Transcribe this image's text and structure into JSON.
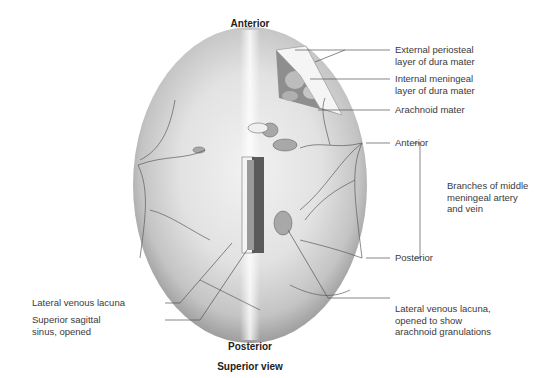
{
  "figure": {
    "orientation_top": "Anterior",
    "orientation_bottom": "Posterior",
    "caption": "Superior view"
  },
  "labels_right": {
    "external_periosteal": "External periosteal\nlayer of dura mater",
    "internal_meningeal": "Internal meningeal\nlayer of dura mater",
    "arachnoid": "Arachnoid mater",
    "mma_anterior": "Anterior",
    "mma_posterior": "Posterior",
    "mma_group": "Branches of middle\nmeningeal artery\nand vein",
    "lateral_lacuna_opened": "Lateral venous lacuna,\nopened to show\narachnoid granulations"
  },
  "labels_left": {
    "lateral_lacuna": "Lateral venous lacuna",
    "superior_sagittal": "Superior sagittal\nsinus, opened"
  },
  "colors": {
    "skull_light": "#eeeeee",
    "skull_mid": "#cfcfcf",
    "skull_edge": "#9a9a9a",
    "vessel": "#555555",
    "leader": "#555555"
  }
}
